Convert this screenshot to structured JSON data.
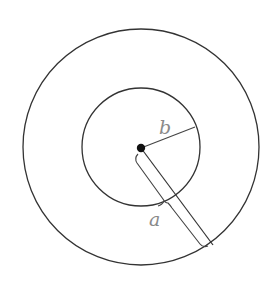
{
  "diagram": {
    "type": "concentric-circles",
    "colors": {
      "stroke": "#333333",
      "label": "#8a8a8a",
      "dot": "#111111",
      "background": "#ffffff"
    },
    "center": {
      "x": 141,
      "y": 148
    },
    "outer_circle": {
      "radius": 118
    },
    "inner_circle": {
      "radius": 59
    },
    "labels": {
      "b": "b",
      "a": "a"
    },
    "segments": {
      "b_radius": {
        "from": [
          141,
          148
        ],
        "to": [
          195,
          127
        ],
        "label": "b"
      },
      "a_radius": {
        "from": [
          141,
          148
        ],
        "to": [
          213,
          245
        ],
        "label": "a"
      }
    }
  }
}
